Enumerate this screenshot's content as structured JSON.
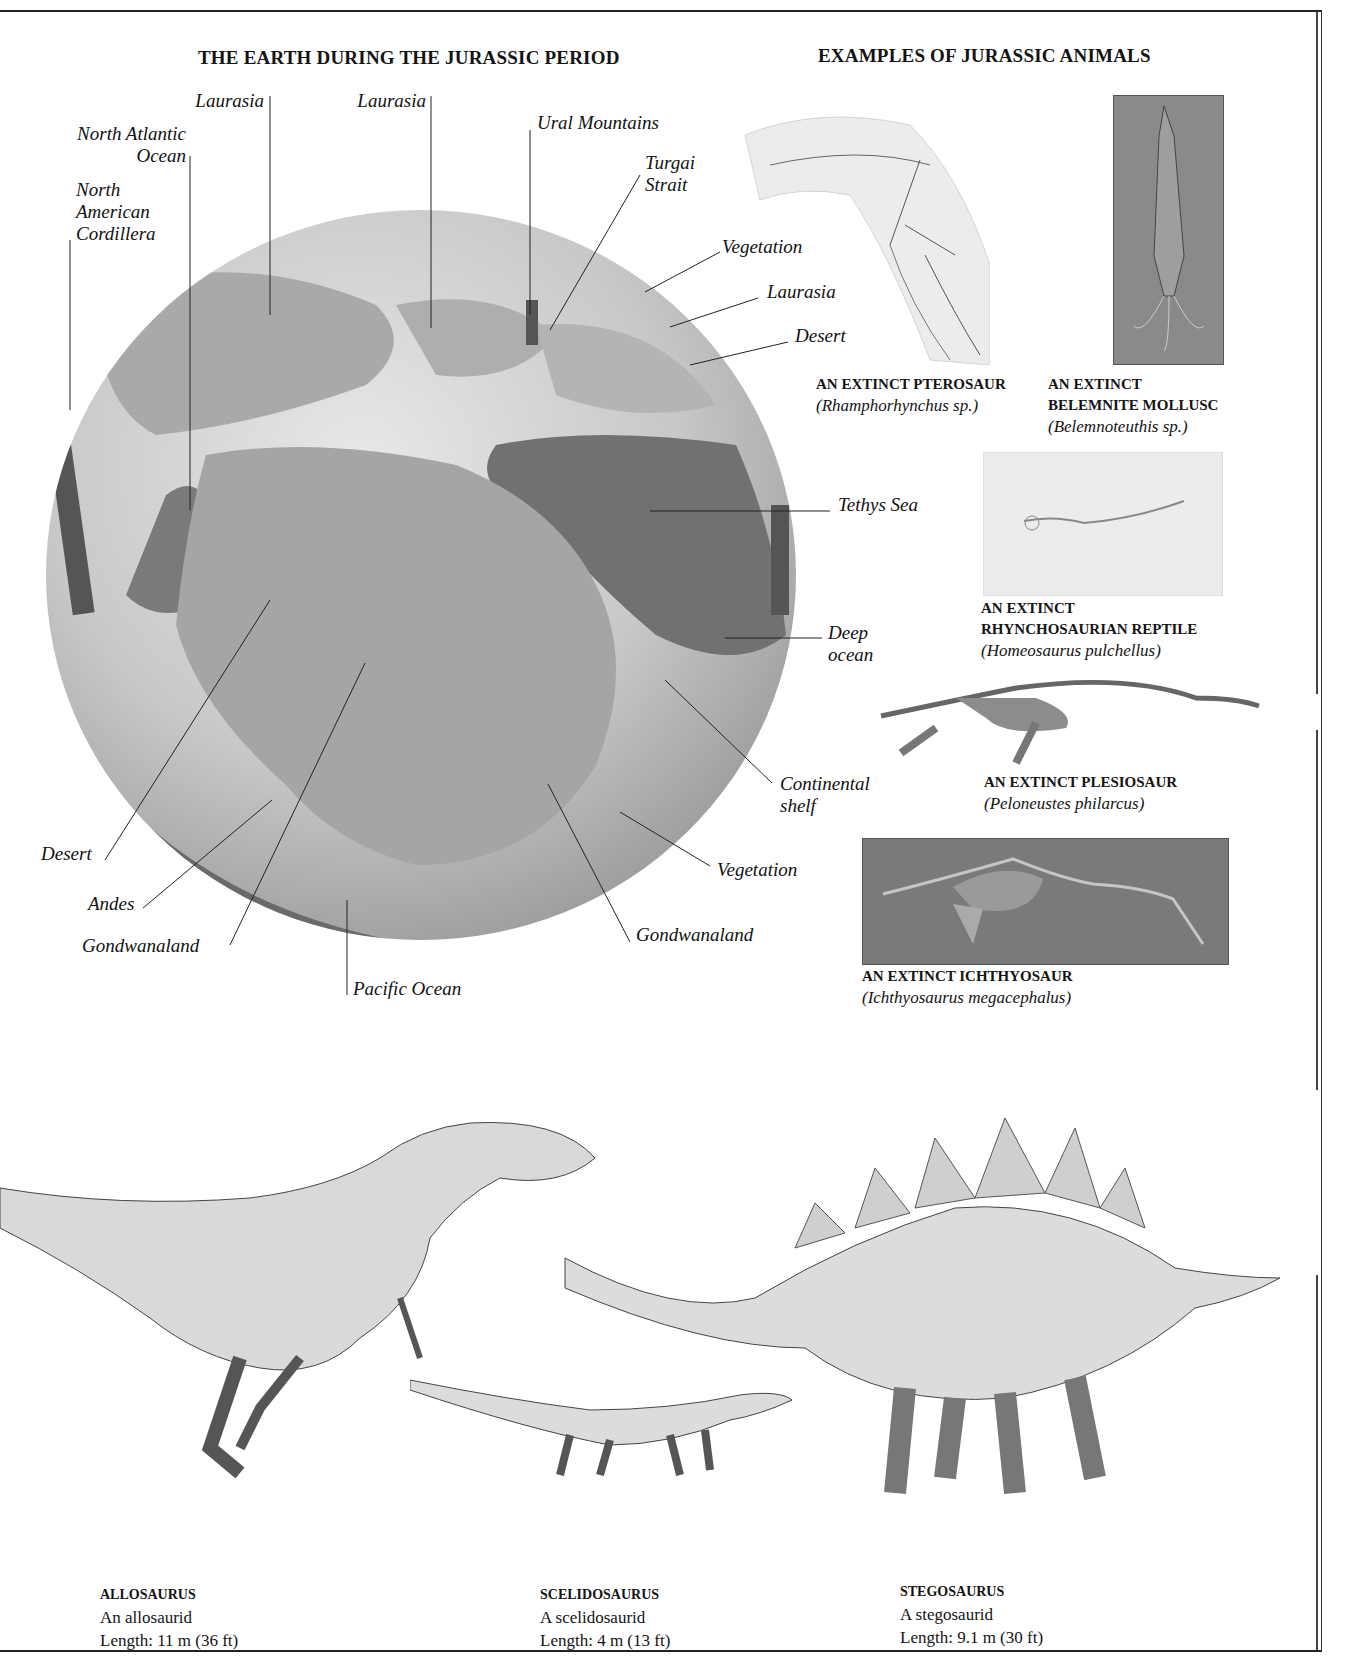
{
  "headings": {
    "globe": "THE EARTH DURING THE JURASSIC PERIOD",
    "animals": "EXAMPLES OF JURASSIC ANIMALS"
  },
  "globe_labels": [
    {
      "id": "laurasia-1",
      "text": "Laurasia"
    },
    {
      "id": "laurasia-2",
      "text": "Laurasia"
    },
    {
      "id": "north-atlantic",
      "text": "North Atlantic\nOcean"
    },
    {
      "id": "na-cordillera",
      "text": "North\nAmerican\nCordillera"
    },
    {
      "id": "ural",
      "text": "Ural Mountains"
    },
    {
      "id": "turgai",
      "text": "Turgai\nStrait"
    },
    {
      "id": "vegetation-1",
      "text": "Vegetation"
    },
    {
      "id": "laurasia-3",
      "text": "Laurasia"
    },
    {
      "id": "desert-1",
      "text": "Desert"
    },
    {
      "id": "tethys",
      "text": "Tethys Sea"
    },
    {
      "id": "deep-ocean",
      "text": "Deep\nocean"
    },
    {
      "id": "continental-shelf",
      "text": "Continental\nshelf"
    },
    {
      "id": "vegetation-2",
      "text": "Vegetation"
    },
    {
      "id": "gondwanaland-2",
      "text": "Gondwanaland"
    },
    {
      "id": "pacific",
      "text": "Pacific Ocean"
    },
    {
      "id": "gondwanaland-1",
      "text": "Gondwanaland"
    },
    {
      "id": "andes",
      "text": "Andes"
    },
    {
      "id": "desert-2",
      "text": "Desert"
    }
  ],
  "fossils": [
    {
      "title": "AN EXTINCT PTEROSAUR",
      "species": "(Rhamphorhynchus sp.)"
    },
    {
      "title": "AN EXTINCT\nBELEMNITE MOLLUSC",
      "species": "(Belemnoteuthis sp.)"
    },
    {
      "title": "AN EXTINCT\nRHYNCHOSAURIAN REPTILE",
      "species": "(Homeosaurus pulchellus)"
    },
    {
      "title": "AN EXTINCT PLESIOSAUR",
      "species": "(Peloneustes philarcus)"
    },
    {
      "title": "AN EXTINCT ICHTHYOSAUR",
      "species": "(Ichthyosaurus megacephalus)"
    }
  ],
  "dinosaurs": [
    {
      "name": "ALLOSAURUS",
      "family": "An allosaurid",
      "length": "Length: 11 m (36 ft)"
    },
    {
      "name": "SCELIDOSAURUS",
      "family": "A scelidosaurid",
      "length": "Length: 4 m (13 ft)"
    },
    {
      "name": "STEGOSAURUS",
      "family": "A stegosaurid",
      "length": "Length: 9.1 m (30 ft)"
    }
  ],
  "colors": {
    "ocean_deep": "#6e6e6e",
    "ocean_shelf": "#b5b5b5",
    "land": "#a9a9a9",
    "ink": "#141414"
  }
}
